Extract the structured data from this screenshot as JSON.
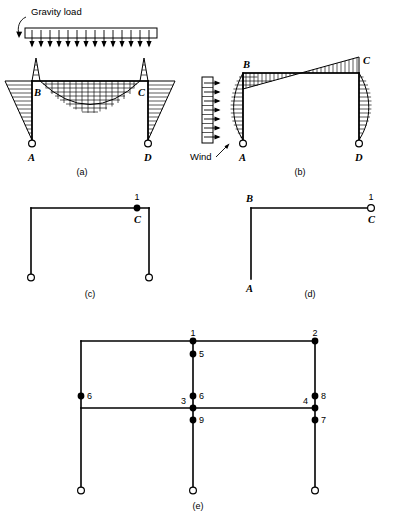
{
  "figure": {
    "width": 396,
    "height": 517,
    "ink_color": "#000000",
    "background_color": "#ffffff"
  },
  "panels": [
    {
      "id": "a",
      "caption": "(a)",
      "load_label": "Gravity load",
      "joint_labels": [
        "B",
        "C",
        "A",
        "D"
      ],
      "description": "Portal frame under uniform gravity load with bending moment diagram"
    },
    {
      "id": "b",
      "caption": "(b)",
      "load_label": "Wind",
      "joint_labels": [
        "B",
        "C",
        "A",
        "D"
      ],
      "description": "Portal frame under lateral wind load with bending moment diagram"
    },
    {
      "id": "c",
      "caption": "(c)",
      "joint_labels": [
        "C"
      ],
      "dof_labels": [
        "1"
      ],
      "description": "Portal frame with single rotational degree of freedom at joint C"
    },
    {
      "id": "d",
      "caption": "(d)",
      "joint_labels": [
        "B",
        "A",
        "C"
      ],
      "dof_labels": [
        "1"
      ],
      "description": "Cantilever beam-column with one degree of freedom at free end C"
    },
    {
      "id": "e",
      "caption": "(e)",
      "dof_labels": [
        "1",
        "2",
        "3",
        "4",
        "5",
        "6",
        "7",
        "8",
        "9",
        "6"
      ],
      "description": "Two-bay two-story frame with nine numbered degrees of freedom"
    }
  ],
  "panel_e_nodes": [
    {
      "id": "n1",
      "label": "1",
      "x": 193,
      "y": 341,
      "label_dx": 0,
      "label_dy": -5,
      "anchor": "middle"
    },
    {
      "id": "n2",
      "label": "2",
      "x": 315,
      "y": 341,
      "label_dx": 0,
      "label_dy": -5,
      "anchor": "middle"
    },
    {
      "id": "n5",
      "label": "5",
      "x": 193,
      "y": 354,
      "label_dx": 6,
      "label_dy": 3,
      "anchor": "start"
    },
    {
      "id": "n6left",
      "label": "6",
      "x": 81,
      "y": 396,
      "label_dx": 6,
      "label_dy": 3,
      "anchor": "start"
    },
    {
      "id": "n6center",
      "label": "6",
      "x": 193,
      "y": 396,
      "label_dx": 6,
      "label_dy": 3,
      "anchor": "start"
    },
    {
      "id": "n3",
      "label": "3",
      "x": 193,
      "y": 408,
      "label_dx": -7,
      "label_dy": -4,
      "anchor": "end"
    },
    {
      "id": "n4",
      "label": "4",
      "x": 315,
      "y": 408,
      "label_dx": -7,
      "label_dy": -4,
      "anchor": "end"
    },
    {
      "id": "n8",
      "label": "8",
      "x": 315,
      "y": 396,
      "label_dx": 6,
      "label_dy": 3,
      "anchor": "start"
    },
    {
      "id": "n9",
      "label": "9",
      "x": 193,
      "y": 420,
      "label_dx": 6,
      "label_dy": 3,
      "anchor": "start"
    },
    {
      "id": "n7",
      "label": "7",
      "x": 315,
      "y": 420,
      "label_dx": 6,
      "label_dy": 3,
      "anchor": "start"
    }
  ],
  "captions": {
    "a": "(a)",
    "b": "(b)",
    "c": "(c)",
    "d": "(d)",
    "e": "(e)"
  },
  "labels": {
    "gravity_load": "Gravity load",
    "wind": "Wind",
    "A": "A",
    "B": "B",
    "C": "C",
    "D": "D",
    "one": "1",
    "two": "2",
    "three": "3",
    "four": "4",
    "five": "5",
    "six": "6",
    "seven": "7",
    "eight": "8",
    "nine": "9"
  }
}
